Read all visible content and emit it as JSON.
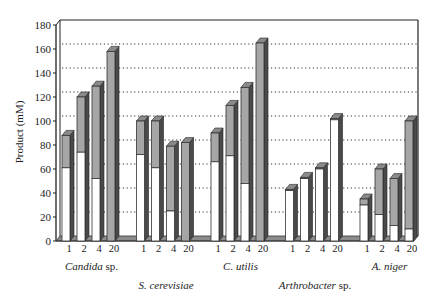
{
  "chart_data": {
    "type": "bar",
    "subtype": "stacked-3d",
    "title": "",
    "xlabel": "",
    "ylabel": "Product (mM)",
    "ylim": [
      0,
      180
    ],
    "yticks": [
      0,
      20,
      40,
      60,
      80,
      100,
      120,
      140,
      160,
      180
    ],
    "grid": true,
    "legend": null,
    "categories": [
      "1",
      "2",
      "4",
      "20"
    ],
    "groups": [
      {
        "name": "Candida sp.",
        "italic_part": "Candida",
        "suffix": " sp.",
        "label_row": 1,
        "bottom": [
          61,
          74,
          52,
          0
        ],
        "total": [
          88,
          120,
          129,
          158
        ]
      },
      {
        "name": "S. cerevisiae",
        "italic_part": "S. cerevisiae",
        "suffix": "",
        "label_row": 2,
        "bottom": [
          72,
          61,
          25,
          0
        ],
        "total": [
          100,
          100,
          79,
          82
        ]
      },
      {
        "name": "C. utilis",
        "italic_part": "C. utilis",
        "suffix": "",
        "label_row": 1,
        "bottom": [
          66,
          71,
          48,
          0
        ],
        "total": [
          90,
          113,
          128,
          165
        ]
      },
      {
        "name": "Arthrobacter sp.",
        "italic_part": "Arthrobacter",
        "suffix": " sp.",
        "label_row": 2,
        "bottom": [
          42,
          52,
          60,
          101
        ],
        "total": [
          43,
          53,
          61,
          102
        ]
      },
      {
        "name": "A. niger",
        "italic_part": "A. niger",
        "suffix": "",
        "label_row": 1,
        "bottom": [
          30,
          22,
          13,
          10
        ],
        "total": [
          35,
          60,
          52,
          100
        ]
      }
    ],
    "series": [
      {
        "name": "lower segment",
        "color": "#ffffff"
      },
      {
        "name": "upper segment",
        "color": "#a6a6a6"
      }
    ]
  },
  "colors": {
    "bar_outline": "#333333",
    "bar_side": "#4a4a4a",
    "floor": "#8c8c8c",
    "axis": "#222222"
  }
}
